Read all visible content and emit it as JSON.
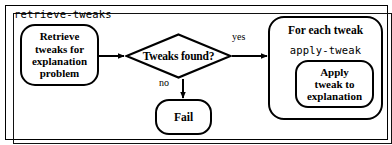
{
  "diagram": {
    "procedure_label": "retrieve-tweaks",
    "nodes": {
      "retrieve": {
        "lines": [
          "Retrieve",
          "tweaks for",
          "explanation",
          "problem"
        ]
      },
      "decision": {
        "label": "Tweaks found?"
      },
      "fail": {
        "lines": [
          "Fail"
        ]
      },
      "foreach": {
        "title": "For each tweak",
        "procedure_label": "apply-tweak"
      },
      "apply": {
        "lines": [
          "Apply",
          "tweak to",
          "explanation"
        ]
      }
    },
    "edges": {
      "yes": "yes",
      "no": "no"
    },
    "caption_fragment": "",
    "colors": {
      "stroke": "#000000",
      "background": "#ffffff"
    }
  }
}
